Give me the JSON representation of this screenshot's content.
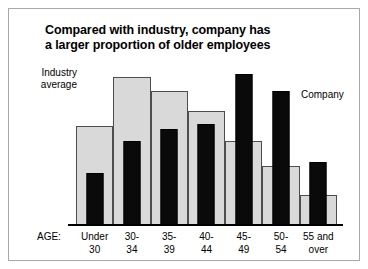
{
  "figure": {
    "title_line1": "Compared with industry, company has",
    "title_line2": "a larger proportion of older employees",
    "axis_prefix": "AGE:",
    "label_industry": "Industry\naverage",
    "label_company": "Company"
  },
  "colors": {
    "industry_fill": "#d9d9d9",
    "industry_stroke": "#4d4d4d",
    "company_fill": "#0a0a0a",
    "frame": "#a8a8a8",
    "axis": "#000000",
    "background": "#ffffff"
  },
  "chart_data": {
    "type": "bar",
    "title": "Compared with industry, company has a larger proportion of older employees",
    "xlabel": "AGE:",
    "ylabel": "",
    "grid": false,
    "legend_position": "inline-annotations",
    "categories": [
      "Under\n30",
      "30-\n34",
      "35-\n39",
      "40-\n44",
      "45-\n49",
      "50-\n54",
      "55 and\nover"
    ],
    "ylim": [
      0,
      100
    ],
    "series": [
      {
        "name": "Industry average",
        "values": [
          64,
          95,
          86,
          73,
          54,
          38,
          20
        ]
      },
      {
        "name": "Company",
        "values": [
          34,
          54,
          62,
          65,
          97,
          86,
          41
        ]
      }
    ]
  }
}
